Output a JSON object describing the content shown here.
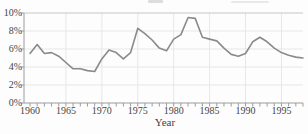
{
  "chart_data": {
    "type": "line",
    "title": "",
    "xlabel": "Year",
    "ylabel": "",
    "x": [
      1960,
      1961,
      1962,
      1963,
      1964,
      1965,
      1966,
      1967,
      1968,
      1969,
      1970,
      1971,
      1972,
      1973,
      1974,
      1975,
      1976,
      1977,
      1978,
      1979,
      1980,
      1981,
      1982,
      1983,
      1984,
      1985,
      1986,
      1987,
      1988,
      1989,
      1990,
      1991,
      1992,
      1993,
      1994,
      1995,
      1996,
      1997,
      1998
    ],
    "values": [
      5.5,
      6.5,
      5.5,
      5.6,
      5.2,
      4.5,
      3.8,
      3.8,
      3.6,
      3.5,
      4.9,
      5.9,
      5.6,
      4.9,
      5.6,
      8.3,
      7.7,
      7.0,
      6.1,
      5.8,
      7.1,
      7.6,
      9.5,
      9.4,
      7.3,
      7.1,
      6.9,
      6.1,
      5.4,
      5.2,
      5.5,
      6.8,
      7.3,
      6.8,
      6.1,
      5.6,
      5.3,
      5.1,
      5.0
    ],
    "ylim": [
      0,
      10
    ],
    "y_tick_values": [
      10,
      8,
      6,
      4,
      2,
      0
    ],
    "y_tick_labels": [
      "10%",
      "8%",
      "6%",
      "4%",
      "2%",
      "0%"
    ],
    "x_label_years": [
      1960,
      1965,
      1970,
      1975,
      1980,
      1985,
      1990,
      1995
    ],
    "x_tick_labels": [
      "1960",
      "1965",
      "1970",
      "1975",
      "1980",
      "1985",
      "1990",
      "1995"
    ],
    "x_minor_tick_every": 1,
    "x_axis_range": [
      1960,
      1998
    ],
    "grid": true,
    "gridline_y_values": [
      2,
      4,
      6,
      8
    ],
    "gridline_x_years": [
      1965,
      1970,
      1975,
      1980,
      1985,
      1990,
      1995
    ],
    "legend": "none",
    "line_color": "#8a8a8a",
    "grid_color": "#e7e7e7",
    "axis_color": "#9c9c9c",
    "top_frame_color": "#c6c6c6",
    "tick_color": "#9c9c9c",
    "label_color": "#454545"
  }
}
